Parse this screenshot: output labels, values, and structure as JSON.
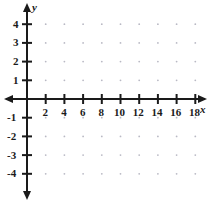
{
  "chart_data": {
    "type": "scatter",
    "title": "",
    "xlabel": "x",
    "ylabel": "y",
    "grid": true,
    "grid_style": "dotted",
    "legend": "none",
    "xlim": [
      -1.2,
      19.8
    ],
    "ylim": [
      -5.1,
      5.2
    ],
    "x_tick_values": [
      2,
      4,
      6,
      8,
      10,
      12,
      14,
      16,
      18
    ],
    "x_tick_labels": [
      "2",
      "4",
      "6",
      "8",
      "10",
      "12",
      "14",
      "16",
      "18"
    ],
    "y_tick_values": [
      4,
      3,
      2,
      1,
      -1,
      -2,
      -3,
      -4
    ],
    "y_tick_labels": [
      "4",
      "3",
      "2",
      "1",
      "-1",
      "-2",
      "-3",
      "-4"
    ],
    "x_minor_step": 2,
    "y_minor_step": 1,
    "origin_label": "",
    "series": [],
    "values": [],
    "categories": [],
    "axis_arrows": [
      "left",
      "right",
      "up",
      "down"
    ],
    "colors": {
      "axis": "#1a1a1a",
      "grid_dot": "#b9b9c4",
      "label": "#1a1a1a",
      "background": "#ffffff"
    }
  },
  "axes": {
    "x_name": "x",
    "y_name": "y"
  },
  "geometry": {
    "origin_x": 27,
    "origin_y": 99,
    "unit_x": 9.35,
    "unit_y": 18.7
  }
}
